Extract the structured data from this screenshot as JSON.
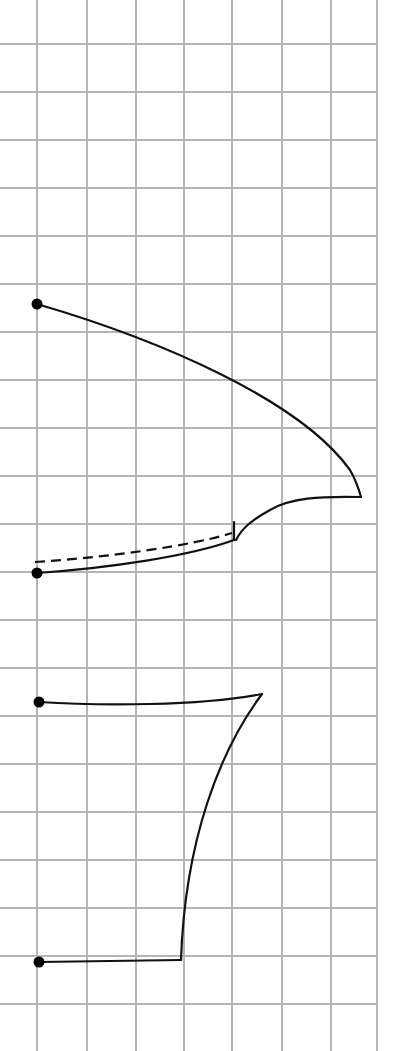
{
  "diagram": {
    "type": "sewing-pattern-on-grid",
    "background_color": "#ffffff",
    "grid": {
      "color": "#b4b4b4",
      "vertical_lines_x": [
        37,
        87,
        136,
        184,
        232,
        282,
        331,
        377
      ],
      "horizontal_lines_y": [
        44,
        92,
        140,
        188,
        236,
        284,
        332,
        380,
        428,
        476,
        524,
        572,
        620,
        668,
        716,
        764,
        812,
        860,
        908,
        956,
        1004
      ],
      "right_edge_x": 377
    },
    "stroke_color": "#111111",
    "upper_piece": {
      "anchor_points": [
        {
          "name": "top-left-point",
          "x": 37,
          "y": 304
        },
        {
          "name": "bottom-left-point",
          "x": 37,
          "y": 573
        }
      ],
      "tip": {
        "x": 361,
        "y": 497
      },
      "notch": {
        "x": 234,
        "y": 540
      },
      "dashed_guide": {
        "start": {
          "x": 35,
          "y": 562
        },
        "end": {
          "x": 232,
          "y": 533
        }
      }
    },
    "lower_piece": {
      "anchor_points": [
        {
          "name": "upper-left-point",
          "x": 39,
          "y": 702
        },
        {
          "name": "lower-left-point",
          "x": 39,
          "y": 962
        }
      ],
      "tip": {
        "x": 262,
        "y": 694
      },
      "corner": {
        "x": 181,
        "y": 960
      }
    }
  }
}
